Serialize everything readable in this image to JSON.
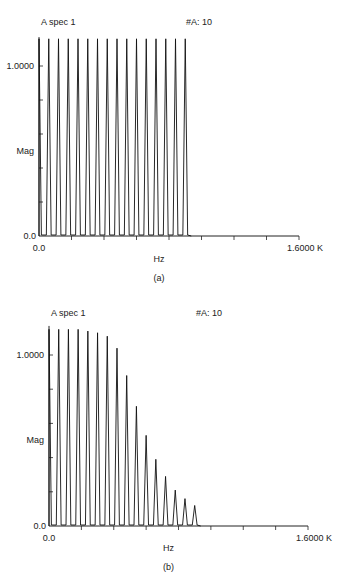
{
  "chart_data": [
    {
      "id": "a",
      "type": "line",
      "title": "A spec 1",
      "annotation": "#A: 10",
      "caption": "(a)",
      "xlabel": "Hz",
      "ylabel": "Mag",
      "x_tick_labels": [
        "0.0",
        "1.6000 K"
      ],
      "y_tick_labels": [
        "0.0",
        "1.0000"
      ],
      "xlim": [
        0,
        1600
      ],
      "ylim": [
        0,
        1.17
      ],
      "x_minor_ticks": 8,
      "y_minor_ticks": 5,
      "grid": false,
      "peak_freqs_hz": [
        0,
        60,
        120,
        180,
        240,
        300,
        360,
        420,
        480,
        540,
        600,
        660,
        720,
        780,
        840,
        900
      ],
      "peak_mags": [
        1.16,
        1.16,
        1.16,
        1.16,
        1.16,
        1.16,
        1.16,
        1.16,
        1.16,
        1.16,
        1.16,
        1.16,
        1.16,
        1.16,
        1.16,
        1.16
      ]
    },
    {
      "id": "b",
      "type": "line",
      "title": "A spec 1",
      "annotation": "#A: 10",
      "caption": "(b)",
      "xlabel": "Hz",
      "ylabel": "Mag",
      "x_tick_labels": [
        "0.0",
        "1.6000 K"
      ],
      "y_tick_labels": [
        "0.0",
        "1.0000"
      ],
      "xlim": [
        0,
        1600
      ],
      "ylim": [
        0,
        1.17
      ],
      "x_minor_ticks": 8,
      "y_minor_ticks": 5,
      "grid": false,
      "peak_freqs_hz": [
        0,
        60,
        120,
        180,
        240,
        300,
        360,
        420,
        480,
        540,
        600,
        660,
        720,
        780,
        840,
        900
      ],
      "peak_mags": [
        1.15,
        1.15,
        1.15,
        1.15,
        1.14,
        1.13,
        1.11,
        1.04,
        0.88,
        0.7,
        0.53,
        0.39,
        0.29,
        0.21,
        0.16,
        0.12
      ]
    }
  ],
  "layout": [
    {
      "x0": 39,
      "x1": 299,
      "y0": 236,
      "y1": 66,
      "titleY": 25,
      "titleX": 41,
      "annX": 186,
      "xlabY": 262,
      "capY": 281,
      "magY": 154
    },
    {
      "x0": 49,
      "x1": 308,
      "y0": 526,
      "y1": 355,
      "titleY": 316,
      "titleX": 51,
      "annX": 196,
      "xlabY": 551,
      "capY": 570,
      "magY": 443
    }
  ]
}
